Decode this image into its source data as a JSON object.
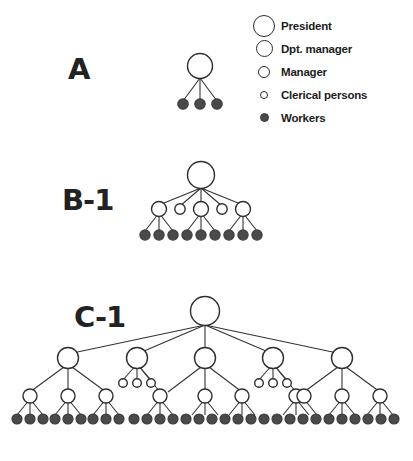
{
  "figure": {
    "background_color": "#ffffff",
    "node_open_fill": "#ffffff",
    "node_stroke_color": "#2e2e2e",
    "node_filled_color": "#4a4a4a",
    "edge_color": "#333333"
  },
  "legend": {
    "items": [
      {
        "label": "President",
        "marker": "large-open-circle",
        "radius": 11.0,
        "filled": false
      },
      {
        "label": "Dpt. manager",
        "marker": "medium-open-circle",
        "radius": 8.5,
        "filled": false
      },
      {
        "label": "Manager",
        "marker": "small-open-circle",
        "radius": 6.0,
        "filled": false
      },
      {
        "label": "Clerical persons",
        "marker": "tiny-open-circle",
        "radius": 4.0,
        "filled": false
      },
      {
        "label": "Workers",
        "marker": "small-filled-circle",
        "radius": 4.5,
        "filled": true
      }
    ]
  },
  "diagrams": [
    {
      "id": "A",
      "label": "A",
      "levels": [
        "President",
        "Workers"
      ],
      "counts": {
        "president": 1,
        "dpt_manager": 0,
        "manager": 0,
        "clerical": 0,
        "workers": 3
      },
      "total_nodes": 4
    },
    {
      "id": "B-1",
      "label": "B-1",
      "levels": [
        "President",
        "Manager",
        "Clerical persons",
        "Workers"
      ],
      "counts": {
        "president": 1,
        "dpt_manager": 0,
        "manager": 3,
        "clerical": 2,
        "workers": 9
      },
      "total_nodes": 15
    },
    {
      "id": "C-1",
      "label": "C-1",
      "levels": [
        "President",
        "Dpt. manager",
        "Manager",
        "Clerical persons",
        "Workers"
      ],
      "counts": {
        "president": 1,
        "dpt_manager": 5,
        "manager": 10,
        "clerical": 6,
        "workers": 30
      },
      "total_nodes": 52
    }
  ]
}
